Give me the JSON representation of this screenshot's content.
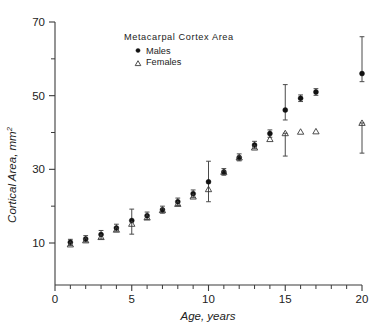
{
  "figure": {
    "legend": {
      "title": "Metacarpal  Cortex  Area",
      "series": [
        {
          "label": "Males",
          "marker": "filled-circle"
        },
        {
          "label": "Females",
          "marker": "open-triangle"
        }
      ]
    }
  },
  "chart_data": {
    "type": "scatter",
    "title": "Metacarpal  Cortex  Area",
    "xlabel": "Age,  years",
    "ylabel": "Cortical Area,  mm",
    "ylabel_superscript": "2",
    "xlim": [
      0,
      20
    ],
    "ylim": [
      0,
      70
    ],
    "grid": false,
    "legend_position": "top-center",
    "x_ticks_major": [
      0,
      5,
      10,
      15,
      20
    ],
    "x_ticks_major_labels": [
      "0",
      "5",
      "10",
      "15",
      "20"
    ],
    "x_ticks_minor": [
      1,
      2,
      3,
      4,
      6,
      7,
      8,
      9,
      11,
      12,
      13,
      14,
      16,
      17,
      18,
      19
    ],
    "y_ticks_major": [
      10,
      30,
      50,
      70
    ],
    "y_ticks_major_labels": [
      "10",
      "30",
      "50",
      "70"
    ],
    "y_ticks_minor": [
      20,
      40,
      60
    ],
    "x": [
      1,
      2,
      3,
      4,
      5,
      6,
      7,
      8,
      9,
      10,
      11,
      12,
      13,
      14,
      15,
      16,
      17,
      20
    ],
    "series": [
      {
        "name": "Males",
        "marker": "filled-circle",
        "values": [
          10.2,
          11.1,
          12.3,
          14.1,
          16.1,
          17.4,
          19.0,
          21.2,
          23.4,
          26.6,
          29.3,
          33.2,
          36.6,
          39.7,
          46.1,
          49.3,
          51.0,
          56.0
        ],
        "err_low": [
          9.3,
          10.3,
          11.1,
          13.2,
          12.4,
          16.4,
          18.1,
          20.2,
          22.3,
          21.2,
          28.4,
          32.3,
          35.6,
          38.7,
          43.4,
          48.4,
          50.1,
          53.8
        ],
        "err_high": [
          11.0,
          12.0,
          13.4,
          15.1,
          19.2,
          18.4,
          20.0,
          22.2,
          24.4,
          32.2,
          30.2,
          34.2,
          37.6,
          40.7,
          53.0,
          50.2,
          51.9,
          66.0
        ]
      },
      {
        "name": "Females",
        "marker": "open-triangle",
        "values": [
          9.6,
          10.7,
          11.6,
          13.6,
          15.2,
          16.9,
          18.9,
          20.6,
          22.6,
          24.6,
          29.3,
          33.2,
          35.9,
          38.2,
          39.8,
          40.2,
          40.3,
          42.6
        ],
        "err_low": [
          9.6,
          10.7,
          11.6,
          13.6,
          15.2,
          16.9,
          18.9,
          20.6,
          22.6,
          24.6,
          29.3,
          33.2,
          35.9,
          38.2,
          33.6,
          40.2,
          40.3,
          34.4
        ],
        "err_high": [
          9.6,
          10.7,
          11.6,
          13.6,
          15.2,
          16.9,
          18.9,
          20.6,
          22.6,
          24.6,
          29.3,
          33.2,
          35.9,
          38.2,
          39.8,
          40.2,
          40.3,
          42.6
        ]
      }
    ]
  }
}
